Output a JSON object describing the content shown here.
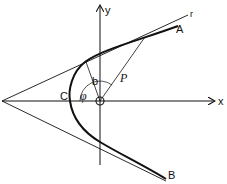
{
  "diagram": {
    "type": "hyperbola-trajectory",
    "colors": {
      "stroke": "#111111",
      "background": "#ffffff"
    },
    "axes": {
      "x_label": "x",
      "y_label": "y"
    },
    "labels": {
      "asymptote": "r",
      "branch_upper": "A",
      "branch_lower": "B",
      "vertex": "C",
      "origin": "O",
      "impact_parameter": "b",
      "radius": "P",
      "angle": "φ"
    }
  }
}
